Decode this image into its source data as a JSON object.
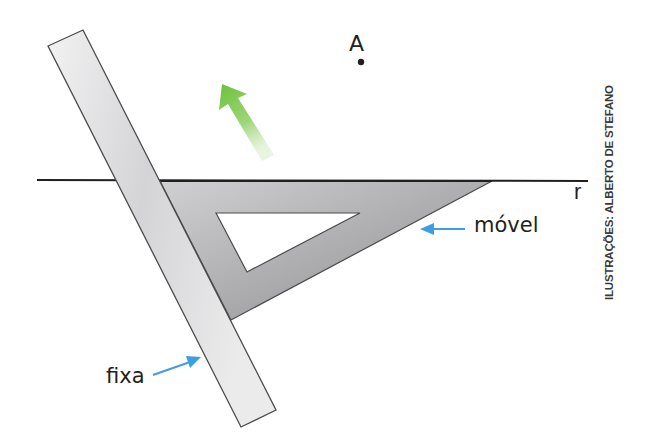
{
  "diagram": {
    "labels": {
      "point": "A",
      "line": "r",
      "moving_tool": "móvel",
      "fixed_tool": "fixa"
    },
    "credit": "ILUSTRAÇÕES: ALBERTO DE STEFANO",
    "colors": {
      "background": "#ffffff",
      "line": "#231f20",
      "ruler_fill": "#d9d9da",
      "set_square_fill": "#a9a9ab",
      "motion_arrow": "#7ccb48",
      "pointer_arrows": "#3d9ee0",
      "text": "#231f20"
    },
    "elements": [
      {
        "id": "line-r",
        "type": "line",
        "label": "r"
      },
      {
        "id": "point-A",
        "type": "point",
        "label": "A"
      },
      {
        "id": "ruler",
        "type": "tool",
        "label": "fixa"
      },
      {
        "id": "set-square",
        "type": "tool",
        "label": "móvel"
      },
      {
        "id": "motion-arrow",
        "type": "arrow",
        "meaning": "direction of movement of the set square"
      }
    ]
  }
}
